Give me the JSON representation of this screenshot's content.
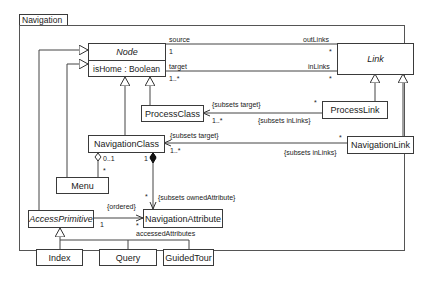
{
  "package": {
    "name": "Navigation"
  },
  "classes": {
    "node": {
      "name": "Node",
      "abstract": true,
      "attribute": "isHome : Boolean"
    },
    "link": {
      "name": "Link",
      "abstract": true
    },
    "process_class": {
      "name": "ProcessClass"
    },
    "process_link": {
      "name": "ProcessLink"
    },
    "navigation_class": {
      "name": "NavigationClass"
    },
    "navigation_link": {
      "name": "NavigationLink"
    },
    "menu": {
      "name": "Menu"
    },
    "access_primitive": {
      "name": "AccessPrimitive",
      "abstract": true
    },
    "navigation_attribute": {
      "name": "NavigationAttribute"
    },
    "index": {
      "name": "Index"
    },
    "query": {
      "name": "Query"
    },
    "guided_tour": {
      "name": "GuidedTour"
    }
  },
  "associations": {
    "node_link_source": {
      "node_role": "source",
      "node_mult": "1",
      "link_role": "outLinks",
      "link_mult": "*"
    },
    "node_link_target": {
      "node_role": "target",
      "node_mult": "1..*",
      "link_role": "inLinks",
      "link_mult": "*"
    },
    "processclass_processlink": {
      "constraint_target": "{subsets target}",
      "target_mult": "1..*",
      "constraint_inlinks": "{subsets inLinks}",
      "link_mult": "*"
    },
    "navclass_navlink": {
      "constraint_target": "{subsets target}",
      "target_mult": "1..*",
      "constraint_inlinks": "{subsets inLinks}",
      "link_mult": "*"
    },
    "navclass_menu": {
      "navclass_mult": "0..1",
      "menu_mult": "*"
    },
    "navclass_navattr": {
      "owner_mult": "1",
      "attr_mult": "*",
      "constraint": "{subsets ownedAttribute}"
    },
    "accessprim_navattr": {
      "constraint": "{ordered}",
      "source_mult": "1",
      "target_mult": "*",
      "role": "accessedAttributes"
    }
  }
}
